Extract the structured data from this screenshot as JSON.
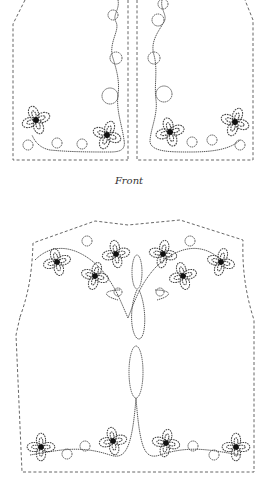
{
  "figure": {
    "front_label": "Front",
    "panels": [
      "front-left",
      "front-right",
      "back"
    ],
    "motifs": {
      "front_left_flowers": 2,
      "front_right_flowers": 2,
      "back_top_flowers": 6,
      "back_bottom_flowers": 4
    }
  }
}
